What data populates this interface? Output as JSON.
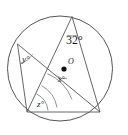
{
  "figure": {
    "background_color": "#ffffff",
    "stroke_color": "#555555",
    "text_color": "#1a1a1a",
    "center_label": "O",
    "center_dot": {
      "cx": 64,
      "cy": 69,
      "r": 2.6
    },
    "circle": {
      "cx": 60,
      "cy": 68.5,
      "r": 52.5
    },
    "vertices": {
      "top": {
        "x": 72,
        "y": 16.5
      },
      "left": {
        "x": 17.5,
        "y": 44
      },
      "bottom_left": {
        "x": 27,
        "y": 112
      },
      "bottom_right": {
        "x": 100,
        "y": 112
      }
    },
    "chords": [
      {
        "name": "top-to-bottom-left",
        "from": "top",
        "to": "bottom_left"
      },
      {
        "name": "top-to-bottom-right",
        "from": "top",
        "to": "bottom_right"
      },
      {
        "name": "left-to-bottom-left",
        "from": "left",
        "to": "bottom_left"
      },
      {
        "name": "left-to-bottom-right",
        "from": "left",
        "to": "bottom_right"
      },
      {
        "name": "bottom-chord",
        "from": "bottom_left",
        "to": "bottom_right"
      }
    ],
    "angle_labels": [
      {
        "id": "angle-32",
        "text": "32°",
        "value": 32,
        "unit": "degrees",
        "at_vertex": "top"
      },
      {
        "id": "angle-y",
        "text": "y°",
        "value": "y",
        "unit": "degrees",
        "at_vertex": "left"
      },
      {
        "id": "angle-x",
        "text": "x°",
        "value": "x",
        "unit": "degrees",
        "at_vertex": "center-O"
      },
      {
        "id": "angle-z",
        "text": "z°",
        "value": "z",
        "unit": "degrees",
        "at_vertex": "bottom_left"
      }
    ]
  }
}
